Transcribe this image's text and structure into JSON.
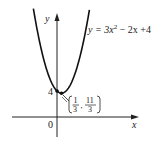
{
  "chart_data": {
    "type": "line",
    "title": "",
    "equation_label": "y = 3x² − 2x + 4",
    "xlabel": "x",
    "ylabel": "y",
    "origin_label": "0",
    "y_intercept_label": "4",
    "vertex": {
      "x_num": "1",
      "x_den": "3",
      "y_num": "11",
      "y_den": "3"
    },
    "function": {
      "a": 3,
      "b": -2,
      "c": 4
    },
    "x_range": [
      -1.75,
      2.4
    ],
    "points": [
      {
        "x": -1.7,
        "y": 16.07
      },
      {
        "x": -1.0,
        "y": 9.0
      },
      {
        "x": 0.0,
        "y": 4.0
      },
      {
        "x": 0.3333,
        "y": 3.6667
      },
      {
        "x": 1.0,
        "y": 5.0
      },
      {
        "x": 2.0,
        "y": 12.0
      },
      {
        "x": 2.37,
        "y": 16.11
      }
    ],
    "grid": false,
    "legend": "none"
  },
  "labels": {
    "eq_prefix": "y = 3x",
    "eq_sup": "2",
    "eq_suffix": " − 2x +4",
    "y_axis": "y",
    "x_axis": "x",
    "origin": "0",
    "intercept": "4",
    "vx_num": "1",
    "vx_den": "3",
    "vy_num": "11",
    "vy_den": "3"
  }
}
